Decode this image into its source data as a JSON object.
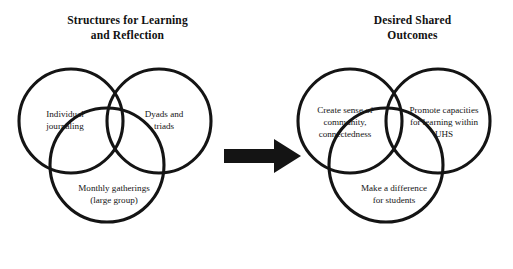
{
  "diagram": {
    "background_color": "#ffffff",
    "stroke_color": "#141414",
    "text_color": "#141414",
    "arrow": {
      "icon": "right-arrow-icon",
      "direction": "right",
      "color": "#141414"
    },
    "left_group": {
      "title": "Structures for Learning and Reflection",
      "title_line_1": "Structures for Learning",
      "title_line_2": "and Reflection",
      "circles": [
        {
          "position": "top-left",
          "label": "Individual journaling",
          "line_1": "Individual",
          "line_2": "journaling"
        },
        {
          "position": "top-right",
          "label": "Dyads and triads",
          "line_1": "Dyads and",
          "line_2": "triads"
        },
        {
          "position": "bottom",
          "label": "Monthly gatherings (large group)",
          "line_1": "Monthly gatherings",
          "line_2": "(large group)"
        }
      ]
    },
    "right_group": {
      "title": "Desired Shared Outcomes",
      "title_line_1": "Desired Shared",
      "title_line_2": "Outcomes",
      "circles": [
        {
          "position": "top-left",
          "label": "Create sense of community, connectedness",
          "line_1": "Create sense of",
          "line_2": "community,",
          "line_3": "connectedness"
        },
        {
          "position": "top-right",
          "label": "Promote capacities for learning within UHS",
          "line_1": "Promote capacities",
          "line_2": "for learning within",
          "line_3": "UHS"
        },
        {
          "position": "bottom",
          "label": "Make a difference for students",
          "line_1": "Make a difference",
          "line_2": "for students",
          "line_3": ""
        }
      ]
    }
  }
}
